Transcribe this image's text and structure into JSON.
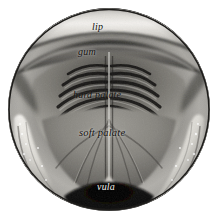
{
  "plate": {
    "kind": "anatomical-engraving",
    "subject": "oral cavity viewed from the front, mouth held open",
    "style": "grayscale halftone engraving in a circular vignette",
    "background_color": "#ffffff",
    "frame": {
      "shape": "circle",
      "outline_color": "#23221f",
      "center_x": 109,
      "center_y": 110,
      "radius": 101
    },
    "tones": {
      "highlight": "#f2f0ec",
      "midtone": "#9a9893",
      "shadow": "#3a3835",
      "deep_shadow": "#121110"
    }
  },
  "labels": [
    {
      "id": "lip",
      "text": "lip",
      "x": 92,
      "y": 22,
      "structure": "upper lip"
    },
    {
      "id": "gum",
      "text": "gum",
      "x": 78,
      "y": 47,
      "structure": "upper gingiva"
    },
    {
      "id": "hard_palate",
      "text": "hard palate",
      "x": 73,
      "y": 90,
      "structure": "hard palate with transverse rugae"
    },
    {
      "id": "soft_palate",
      "text": "soft palate",
      "x": 79,
      "y": 128,
      "structure": "soft palate / velum"
    },
    {
      "id": "vula",
      "text": "vula",
      "x": 97,
      "y": 182,
      "structure": "uvula"
    }
  ],
  "features": {
    "midline_raphe": "vertical pale ridge running down the centre of the palate",
    "rugae_count_per_side": 7,
    "lateral_arches": "pale speckled crescents at lower left and lower right (cheek / dental arch)",
    "throat": "dark opening below the uvula"
  }
}
